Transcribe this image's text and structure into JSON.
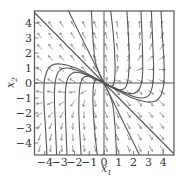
{
  "figure": {
    "type": "phase-portrait",
    "xlabel": "x",
    "xlabel_sub": "1",
    "ylabel": "x",
    "ylabel_sub": "2",
    "x_ticks": [
      -4,
      -3,
      -2,
      -1,
      0,
      1,
      2,
      3,
      4
    ],
    "y_ticks": [
      -4,
      -3,
      -2,
      -1,
      0,
      1,
      2,
      3,
      4
    ],
    "x_tick_labels": [
      "−4",
      "−3",
      "−2",
      "−1",
      "0",
      "1",
      "2",
      "3",
      "4"
    ],
    "y_tick_labels": [
      "−4",
      "−3",
      "−2",
      "−1",
      "0",
      "1",
      "2",
      "3",
      "4"
    ],
    "xlim": [
      -4.7,
      4.7
    ],
    "ylim": [
      -4.8,
      4.8
    ],
    "colors": {
      "frame": "#555555",
      "trajectory": "#555555",
      "arrow": "#777777",
      "axes": "#555555"
    },
    "straight_line_solutions": [
      {
        "name": "eigen-line-slope-minus-1",
        "points": [
          [
            -4.7,
            4.7
          ],
          [
            4.7,
            -4.7
          ]
        ]
      },
      {
        "name": "eigen-line-slope-minus-2",
        "points": [
          [
            -2.4,
            4.8
          ],
          [
            2.4,
            -4.8
          ]
        ]
      }
    ],
    "trajectories_left": [
      [
        [
          0,
          0
        ],
        [
          -0.8,
          0.45
        ],
        [
          -1.8,
          0.95
        ],
        [
          -2.8,
          1.25
        ],
        [
          -3.5,
          1.2
        ],
        [
          -3.85,
          0.8
        ],
        [
          -4.05,
          0
        ],
        [
          -4.05,
          -1.5
        ],
        [
          -3.95,
          -3
        ],
        [
          -3.85,
          -4.8
        ]
      ],
      [
        [
          0,
          0
        ],
        [
          -0.8,
          0.4
        ],
        [
          -1.7,
          0.8
        ],
        [
          -2.5,
          1.0
        ],
        [
          -3.0,
          0.85
        ],
        [
          -3.25,
          0.3
        ],
        [
          -3.35,
          -0.8
        ],
        [
          -3.3,
          -2.5
        ],
        [
          -3.2,
          -4.8
        ]
      ],
      [
        [
          0,
          0
        ],
        [
          -0.8,
          0.35
        ],
        [
          -1.5,
          0.65
        ],
        [
          -2.0,
          0.7
        ],
        [
          -2.4,
          0.4
        ],
        [
          -2.6,
          -0.5
        ],
        [
          -2.6,
          -2.2
        ],
        [
          -2.5,
          -4.8
        ]
      ],
      [
        [
          0,
          0
        ],
        [
          -0.6,
          0.3
        ],
        [
          -1.1,
          0.45
        ],
        [
          -1.45,
          0.3
        ],
        [
          -1.65,
          -0.4
        ],
        [
          -1.7,
          -2.0
        ],
        [
          -1.55,
          -4.8
        ]
      ],
      [
        [
          0,
          0
        ],
        [
          -0.3,
          0.15
        ],
        [
          -0.55,
          0.2
        ],
        [
          -0.7,
          -0.1
        ],
        [
          -0.75,
          -1.2
        ],
        [
          -0.65,
          -3.0
        ],
        [
          -0.45,
          -4.8
        ]
      ],
      [
        [
          0,
          0
        ],
        [
          -0.3,
          0.6
        ],
        [
          -0.6,
          1.5
        ],
        [
          -0.75,
          3.0
        ],
        [
          -0.85,
          4.8
        ]
      ]
    ],
    "vector_field": {
      "v1": [
        0.2,
        -0.133
      ],
      "v2": [
        -0.1,
        0.4
      ],
      "grid_start": -4.35,
      "grid_step": 0.75,
      "grid_count": 12,
      "arrow_length": 0.42
    }
  }
}
